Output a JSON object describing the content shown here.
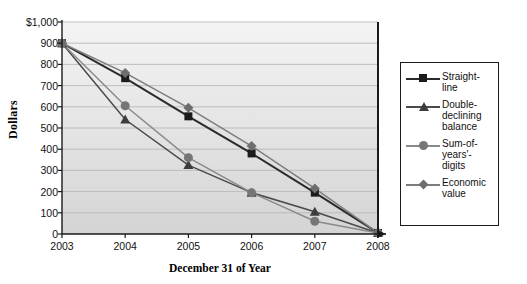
{
  "chart_data": {
    "type": "line",
    "title": "",
    "xlabel": "December 31 of Year",
    "ylabel": "Dollars",
    "categories": [
      "2003",
      "2004",
      "2005",
      "2006",
      "2007",
      "2008"
    ],
    "x": [
      2003,
      2004,
      2005,
      2006,
      2007,
      2008
    ],
    "ylim": [
      0,
      1000
    ],
    "yticks": [
      "$1,000",
      "900",
      "800",
      "700",
      "600",
      "500",
      "400",
      "300",
      "200",
      "100",
      "0"
    ],
    "ytick_values": [
      1000,
      900,
      800,
      700,
      600,
      500,
      400,
      300,
      200,
      100,
      0
    ],
    "grid": true,
    "grid_axis": "y",
    "legend_position": "right",
    "series": [
      {
        "name": "Straight-line",
        "legend_label": "Straight-\nline",
        "marker": "square",
        "color": "#1b1b1b",
        "line_color": "#2b2b2b",
        "values": [
          900,
          735,
          555,
          380,
          195,
          5
        ]
      },
      {
        "name": "Double-declining balance",
        "legend_label": "Double-\ndeclining\nbalance",
        "marker": "triangle",
        "color": "#3d3d3d",
        "line_color": "#4a4a4a",
        "values": [
          900,
          540,
          325,
          195,
          105,
          5
        ]
      },
      {
        "name": "Sum-of-years'-digits",
        "legend_label": "Sum-of-\nyears'-\ndigits",
        "marker": "circle",
        "color": "#767676",
        "line_color": "#8a8a8a",
        "values": [
          900,
          605,
          360,
          195,
          60,
          5
        ]
      },
      {
        "name": "Economic value",
        "legend_label": "Economic\nvalue",
        "marker": "diamond",
        "color": "#6e6e6e",
        "line_color": "#7d7d7d",
        "values": [
          900,
          760,
          595,
          415,
          215,
          5
        ]
      }
    ]
  },
  "plot": {
    "background_top": "#f2f2f2",
    "background_bottom": "#d6d6d6",
    "gridline_color": "#b9b9b9",
    "axis_color": "#1a1a1a"
  }
}
